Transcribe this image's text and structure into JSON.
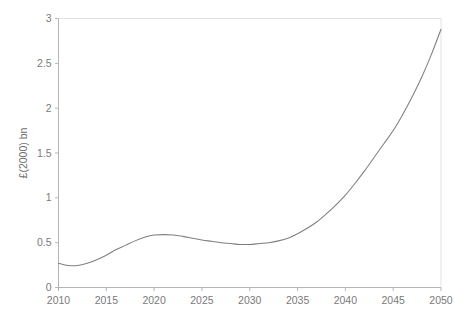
{
  "chart_data": {
    "type": "line",
    "title": "",
    "subtitle": "",
    "xlabel": "",
    "ylabel": "£(2000) bn",
    "xlim": [
      2010,
      2050
    ],
    "ylim": [
      0,
      3
    ],
    "grid": false,
    "legend": false,
    "legend_position": "none",
    "line_color": "#7f7f7f",
    "axis_color": "#c8c8c8",
    "background_color": "#ffffff",
    "xticks": [
      2010,
      2015,
      2020,
      2025,
      2030,
      2035,
      2040,
      2045,
      2050
    ],
    "xtick_labels": [
      "2010",
      "2015",
      "2020",
      "2025",
      "2030",
      "2035",
      "2040",
      "2045",
      "2050"
    ],
    "yticks": [
      0,
      0.5,
      1,
      1.5,
      2,
      2.5,
      3
    ],
    "ytick_labels": [
      "0",
      "0.5",
      "1",
      "1.5",
      "2",
      "2.5",
      "3"
    ],
    "annotations": [],
    "series": [
      {
        "name": "projection",
        "x": [
          2010,
          2011,
          2012,
          2013,
          2014,
          2015,
          2016,
          2017,
          2018,
          2019,
          2020,
          2021,
          2022,
          2023,
          2024,
          2025,
          2026,
          2027,
          2028,
          2029,
          2030,
          2031,
          2032,
          2033,
          2034,
          2035,
          2036,
          2037,
          2038,
          2039,
          2040,
          2041,
          2042,
          2043,
          2044,
          2045,
          2046,
          2047,
          2048,
          2049,
          2050
        ],
        "values": [
          0.27,
          0.245,
          0.245,
          0.27,
          0.31,
          0.36,
          0.42,
          0.47,
          0.52,
          0.56,
          0.585,
          0.59,
          0.585,
          0.57,
          0.55,
          0.53,
          0.515,
          0.5,
          0.49,
          0.48,
          0.48,
          0.49,
          0.5,
          0.52,
          0.55,
          0.6,
          0.66,
          0.73,
          0.82,
          0.92,
          1.03,
          1.16,
          1.3,
          1.45,
          1.6,
          1.75,
          1.93,
          2.13,
          2.35,
          2.6,
          2.88
        ]
      }
    ]
  }
}
